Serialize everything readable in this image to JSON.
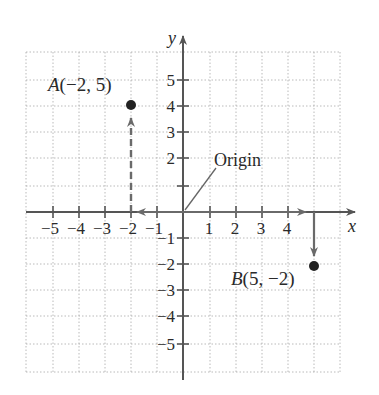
{
  "diagram": {
    "title": "",
    "type": "coordinate-plane",
    "colors": {
      "background": "#ffffff",
      "grid": "#9a9a9a",
      "axis": "#555555",
      "arrow": "#6a6a6a",
      "point": "#222222",
      "text": "#2a2a2a"
    },
    "axes": {
      "x_label": "x",
      "y_label": "y",
      "x_ticks": [
        {
          "value": -5,
          "label": "−5"
        },
        {
          "value": -4,
          "label": "−4"
        },
        {
          "value": -3,
          "label": "−3"
        },
        {
          "value": -2,
          "label": "−2"
        },
        {
          "value": -1,
          "label": "−1"
        },
        {
          "value": 1,
          "label": "1"
        },
        {
          "value": 2,
          "label": "2"
        },
        {
          "value": 3,
          "label": "3"
        },
        {
          "value": 4,
          "label": "4"
        }
      ],
      "y_ticks": [
        {
          "value": 5,
          "label": "5"
        },
        {
          "value": 4,
          "label": "4"
        },
        {
          "value": 3,
          "label": "3"
        },
        {
          "value": 2,
          "label": "2"
        },
        {
          "value": 1,
          "label": ""
        },
        {
          "value": -1,
          "label": "−1"
        },
        {
          "value": -2,
          "label": "−2"
        },
        {
          "value": -3,
          "label": "−3"
        },
        {
          "value": -4,
          "label": "−4"
        },
        {
          "value": -5,
          "label": "−5"
        }
      ],
      "x_range": [
        -6,
        6
      ],
      "y_range": [
        -6,
        6
      ]
    },
    "points": [
      {
        "name": "A",
        "label": "A(−2, 5)",
        "x": -2,
        "y": 4,
        "path_style": "dashed",
        "path": "left along x-axis to x=-2, then up"
      },
      {
        "name": "B",
        "label": "B(5, −2)",
        "x": 5,
        "y": -2,
        "path_style": "solid",
        "path": "right along x-axis to x=5, then down"
      }
    ],
    "annotations": [
      {
        "text": "Origin",
        "points_to": [
          0,
          0
        ]
      }
    ]
  }
}
